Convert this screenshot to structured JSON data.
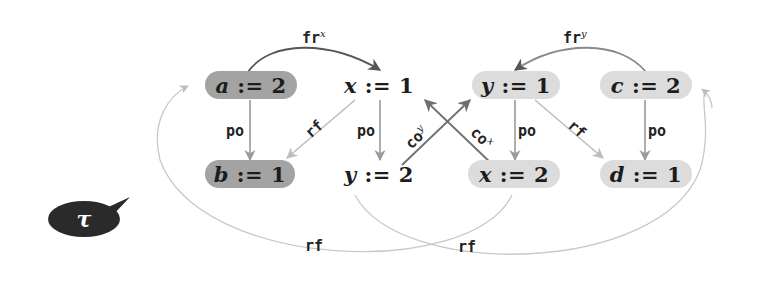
{
  "diagram": {
    "type": "memory-model execution graph",
    "colors": {
      "dark_node": "#a3a3a3",
      "light_node": "#dcdcdc",
      "po_edge": "#9a9a9a",
      "rf_edge": "#bdbdbd",
      "co_edge": "#6f6f6f",
      "fr_edge": "#555555",
      "tau_bubble": "#2a2a2a"
    },
    "nodes": [
      {
        "id": "a2",
        "var": "a",
        "op": ":=",
        "val": "2",
        "style": "dark"
      },
      {
        "id": "x1",
        "var": "x",
        "op": ":=",
        "val": "1",
        "style": "none"
      },
      {
        "id": "y1",
        "var": "y",
        "op": ":=",
        "val": "1",
        "style": "light"
      },
      {
        "id": "c2",
        "var": "c",
        "op": ":=",
        "val": "2",
        "style": "light"
      },
      {
        "id": "b1",
        "var": "b",
        "op": ":=",
        "val": "1",
        "style": "dark"
      },
      {
        "id": "y2",
        "var": "y",
        "op": ":=",
        "val": "2",
        "style": "none"
      },
      {
        "id": "x2",
        "var": "x",
        "op": ":=",
        "val": "2",
        "style": "light"
      },
      {
        "id": "d1",
        "var": "d",
        "op": ":=",
        "val": "1",
        "style": "light"
      }
    ],
    "edges": [
      {
        "from": "a2",
        "to": "x1",
        "label": "fr",
        "sup": "x"
      },
      {
        "from": "c2",
        "to": "y1",
        "label": "fr",
        "sup": "y"
      },
      {
        "from": "a2",
        "to": "b1",
        "label": "po"
      },
      {
        "from": "x1",
        "to": "y2",
        "label": "po"
      },
      {
        "from": "y1",
        "to": "x2",
        "label": "po"
      },
      {
        "from": "c2",
        "to": "d1",
        "label": "po"
      },
      {
        "from": "x1",
        "to": "b1",
        "label": "rf"
      },
      {
        "from": "y1",
        "to": "d1",
        "label": "rf"
      },
      {
        "from": "y2",
        "to": "y1",
        "label": "co",
        "sup": "y"
      },
      {
        "from": "x2",
        "to": "x1",
        "label": "co",
        "sup": "x"
      },
      {
        "from": "x2",
        "to": "a2",
        "label": "rf"
      },
      {
        "from": "y2",
        "to": "c2",
        "label": "rf"
      }
    ],
    "labels": {
      "fr_x": "fr",
      "fr_x_sup": "x",
      "fr_y": "fr",
      "fr_y_sup": "y",
      "po": "po",
      "rf": "rf",
      "co_y": "co",
      "co_y_sup": "y",
      "co_x": "co",
      "co_x_sup": "x"
    },
    "tau": {
      "symbol": "τ"
    }
  }
}
